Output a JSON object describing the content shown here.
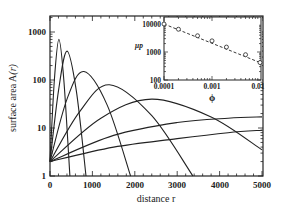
{
  "chart_data": [
    {
      "type": "line",
      "title": "",
      "xlabel": "distance r",
      "ylabel": "surface area A(r)",
      "xscale": "linear",
      "yscale": "log",
      "xlim": [
        0,
        5000
      ],
      "ylim": [
        1,
        2000
      ],
      "x_ticks": [
        "0",
        "1000",
        "2000",
        "3000",
        "4000",
        "5000"
      ],
      "y_ticks": [
        "1",
        "10",
        "100",
        "1000"
      ],
      "grid": false,
      "series": [
        {
          "name": "curve 1",
          "x": [
            0,
            100,
            210,
            330,
            470
          ],
          "y": [
            2,
            90,
            700,
            90,
            1
          ]
        },
        {
          "name": "curve 2",
          "x": [
            0,
            200,
            400,
            620,
            850
          ],
          "y": [
            2,
            60,
            400,
            60,
            1
          ]
        },
        {
          "name": "curve 3",
          "x": [
            0,
            400,
            800,
            1350,
            1900
          ],
          "y": [
            2,
            40,
            150,
            30,
            1
          ]
        },
        {
          "name": "curve 4",
          "x": [
            0,
            700,
            1400,
            2400,
            3370
          ],
          "y": [
            2,
            22,
            80,
            18,
            1
          ]
        },
        {
          "name": "curve 5",
          "x": [
            0,
            1200,
            2400,
            3800,
            5000
          ],
          "y": [
            2,
            16,
            40,
            17,
            3.5
          ]
        },
        {
          "name": "curve 6",
          "x": [
            0,
            1500,
            3000,
            4200,
            5000
          ],
          "y": [
            2,
            7,
            13,
            16,
            17
          ]
        },
        {
          "name": "curve 7",
          "x": [
            0,
            1500,
            3000,
            4200,
            5000
          ],
          "y": [
            2,
            4,
            6,
            8,
            9
          ]
        }
      ],
      "inset": {
        "type": "scatter",
        "xlabel": "ϕ",
        "ylabel": "μ_p",
        "xscale": "log",
        "yscale": "log",
        "xlim": [
          0.0001,
          0.01
        ],
        "ylim": [
          100,
          10000
        ],
        "x_ticks": [
          "0.0001",
          "0.001",
          "0.01"
        ],
        "y_ticks": [
          "100",
          "1000",
          "10000"
        ],
        "marker": "open circle",
        "fit_line": "dashed",
        "points": [
          {
            "x": 0.0001,
            "y": 10000
          },
          {
            "x": 0.0002,
            "y": 6500
          },
          {
            "x": 0.0005,
            "y": 3800
          },
          {
            "x": 0.001,
            "y": 2500
          },
          {
            "x": 0.002,
            "y": 1500
          },
          {
            "x": 0.005,
            "y": 800
          },
          {
            "x": 0.01,
            "y": 420
          }
        ]
      }
    }
  ],
  "labels": {
    "xlabel": "distance r",
    "ylabel_main": "surface area A",
    "ylabel_arg": "(r)",
    "x_ticks": [
      "0",
      "1000",
      "2000",
      "3000",
      "4000",
      "5000"
    ],
    "y_ticks": [
      "1",
      "10",
      "100",
      "1000"
    ],
    "inset_xlabel": "ϕ",
    "inset_ylabel": "μp",
    "inset_x_ticks": [
      "0.0001",
      "0.001",
      "0.01"
    ],
    "inset_y_ticks": [
      "100",
      "1000",
      "10000"
    ]
  }
}
